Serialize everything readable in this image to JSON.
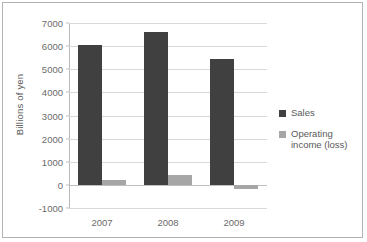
{
  "chart_data": {
    "type": "bar",
    "title": "",
    "subtitle": "",
    "xlabel": "",
    "ylabel": "Billions of yen",
    "categories": [
      "2007",
      "2008",
      "2009"
    ],
    "series": [
      {
        "name": "Sales",
        "values": [
          6050,
          6600,
          5450
        ],
        "color": "#404040"
      },
      {
        "name": "Operating income (loss)",
        "values": [
          230,
          410,
          -180
        ],
        "color": "#a6a6a6"
      }
    ],
    "ylim": [
      -1000,
      7000
    ],
    "ytick_labels": [
      "7000",
      "6000",
      "5000",
      "4000",
      "3000",
      "2000",
      "1000",
      "0",
      "-1000"
    ],
    "ytick_values": [
      7000,
      6000,
      5000,
      4000,
      3000,
      2000,
      1000,
      0,
      -1000
    ],
    "grid": true,
    "legend_position": "right",
    "legend_entries": [
      "Sales",
      "Operating income (loss)"
    ],
    "axis_color": "#b8b8b8",
    "gridline_color": "#d9d9d9",
    "text_color": "#595959",
    "plot_background": "#ffffff",
    "border_color": "#b2b2b2"
  }
}
